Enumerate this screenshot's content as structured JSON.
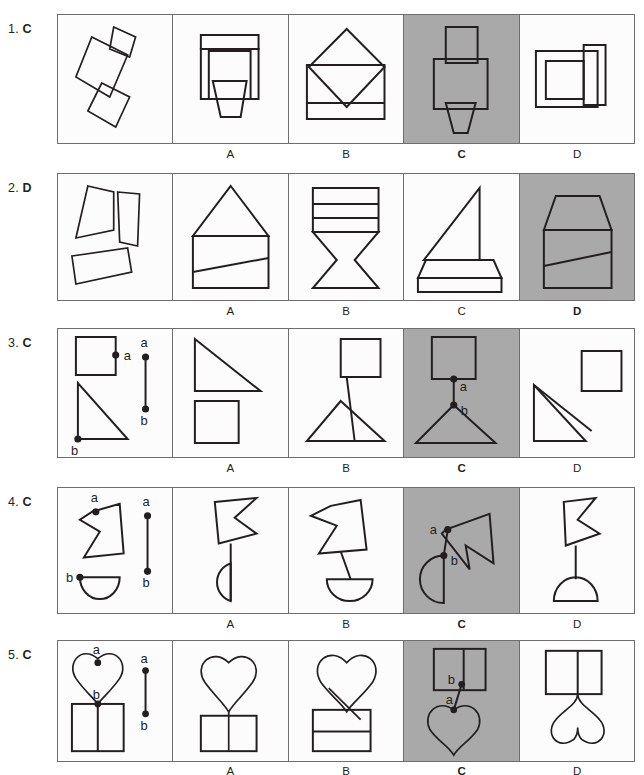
{
  "page": {
    "type": "visual-reasoning-test",
    "background_color": "#ffffff",
    "ink_color": "#231f20",
    "shaded_panel_color": "#a9a9a9",
    "panel_border_color": "#6e6e6e"
  },
  "option_labels": [
    "A",
    "B",
    "C",
    "D"
  ],
  "point_labels": {
    "a": "a",
    "b": "b"
  },
  "rows": [
    {
      "number": "1.",
      "answer": "C",
      "correct_index": 2,
      "prompt_caption": "",
      "panels": [
        {
          "id": "stimulus",
          "shaded": false,
          "description": "three separate tilted quadrilaterals scattered"
        },
        {
          "id": "A",
          "label": "A",
          "shaded": false,
          "description": "stacked rectangles with tapered base"
        },
        {
          "id": "B",
          "label": "B",
          "shaded": false,
          "description": "diamond overlapping a rectangle with a bottom band"
        },
        {
          "id": "C",
          "label": "C",
          "shaded": true,
          "description": "vertical rectangle, wide rectangle, tapered trapezoid"
        },
        {
          "id": "D",
          "label": "D",
          "shaded": false,
          "description": "nested rectangles with a tall side rectangle"
        }
      ]
    },
    {
      "number": "2.",
      "answer": "D",
      "correct_index": 3,
      "prompt_caption": "",
      "panels": [
        {
          "id": "stimulus",
          "shaded": false,
          "description": "trapezoid, narrow tilted quadrilateral, tilted bar"
        },
        {
          "id": "A",
          "label": "A",
          "shaded": false,
          "description": "triangle roof over a rectangle crossed by a slanted line"
        },
        {
          "id": "B",
          "label": "B",
          "shaded": false,
          "description": "banded rectangle over an hourglass"
        },
        {
          "id": "C",
          "label": "C",
          "shaded": false,
          "description": "right triangle sail over a flat trapezoid base"
        },
        {
          "id": "D",
          "label": "D",
          "shaded": true,
          "description": "chamfered top block over a rectangle with a slanted line"
        }
      ]
    },
    {
      "number": "3.",
      "answer": "C",
      "correct_index": 2,
      "prompt_caption": "",
      "panels": [
        {
          "id": "stimulus",
          "shaded": false,
          "description": "square with point a on its right edge, right triangle with point b at its bottom-left corner, and a reference segment a-b"
        },
        {
          "id": "A",
          "label": "A",
          "shaded": false,
          "description": "right triangle above a square, not joined at a and b"
        },
        {
          "id": "B",
          "label": "B",
          "shaded": false,
          "description": "square joined by long connector to a triangle"
        },
        {
          "id": "C",
          "label": "C",
          "shaded": true,
          "description": "square with a at its bottom edge joined by the segment to b at the apex of the triangle"
        },
        {
          "id": "D",
          "label": "D",
          "shaded": false,
          "description": "triangle and square crossed, joined incorrectly"
        }
      ]
    },
    {
      "number": "4.",
      "answer": "C",
      "correct_index": 2,
      "prompt_caption": "",
      "panels": [
        {
          "id": "stimulus",
          "shaded": false,
          "description": "arrow-notched polygon with point a at its top notch, half-disc with point b at its top-left, and a reference segment a-b"
        },
        {
          "id": "A",
          "label": "A",
          "shaded": false,
          "description": "polygon above half-disc joined by a straight stem"
        },
        {
          "id": "B",
          "label": "B",
          "shaded": false,
          "description": "polygon tilted above half-disc joined by a stem"
        },
        {
          "id": "C",
          "label": "C",
          "shaded": true,
          "description": "polygon rotated with a joined to b on the half-disc by the segment"
        },
        {
          "id": "D",
          "label": "D",
          "shaded": false,
          "description": "polygon above a dome joined by a stem"
        }
      ]
    },
    {
      "number": "5.",
      "answer": "C",
      "correct_index": 2,
      "prompt_caption": "",
      "panels": [
        {
          "id": "stimulus",
          "shaded": false,
          "description": "heart with point a at its top cleft, split rectangle with point b at its top edge, and a reference segment a-b"
        },
        {
          "id": "A",
          "label": "A",
          "shaded": false,
          "description": "heart above a split rectangle joined by a stem"
        },
        {
          "id": "B",
          "label": "B",
          "shaded": false,
          "description": "heart joined diagonally to a banded rectangle"
        },
        {
          "id": "C",
          "label": "C",
          "shaded": true,
          "description": "split rectangle on top with b joined by the segment to a on an inverted heart"
        },
        {
          "id": "D",
          "label": "D",
          "shaded": false,
          "description": "split rectangle joined by stem to an inverted heart"
        }
      ]
    }
  ]
}
